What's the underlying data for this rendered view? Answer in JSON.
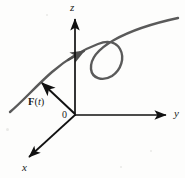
{
  "figure": {
    "kind": "vector-valued-function-space-curve",
    "background_color": "#fdfdfc",
    "axis_color": "#111111",
    "curve_color": "#5a5a5a",
    "vector_color": "#111111",
    "labels": {
      "z_axis": "z",
      "y_axis": "y",
      "x_axis": "x",
      "origin": "0",
      "vector_bold": "F",
      "vector_open_paren": "(",
      "vector_variable": "t",
      "vector_close_paren": ")"
    },
    "axes": [
      {
        "name": "z-axis",
        "label": "z",
        "from": [
          75,
          115
        ],
        "to": [
          75,
          17
        ],
        "arrow": true
      },
      {
        "name": "y-axis",
        "label": "y",
        "from": [
          75,
          115
        ],
        "to": [
          170,
          115
        ],
        "arrow": true
      },
      {
        "name": "x-axis",
        "label": "x",
        "from": [
          75,
          115
        ],
        "to": [
          26,
          160
        ],
        "arrow": true
      }
    ],
    "curve": {
      "name": "space-curve-with-loop",
      "color": "#5a5a5a",
      "stroke_width": 2.4,
      "direction_arrow_at": [
        78,
        55
      ],
      "description": "smooth curve rising from lower-left, crossing the z-axis, then forming a clockwise loop and exiting upper-right"
    },
    "vector": {
      "name": "position-vector-F-of-t",
      "tail": [
        75,
        115
      ],
      "head": [
        40,
        82
      ],
      "label_position": [
        30,
        97
      ]
    }
  }
}
